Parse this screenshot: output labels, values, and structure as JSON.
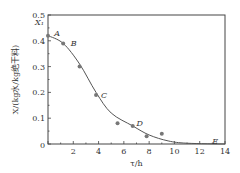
{
  "chart_data": {
    "type": "scatter",
    "title": "",
    "xlabel": "τ/h",
    "ylabel": "X/(kg水/kg绝干料)",
    "xlim": [
      0,
      14
    ],
    "ylim": [
      0,
      0.5
    ],
    "xticks": [
      2,
      4,
      6,
      8,
      10,
      12,
      14
    ],
    "yticks": [
      0,
      0.1,
      0.2,
      0.3,
      0.4,
      0.5
    ],
    "grid": false,
    "points": [
      {
        "x": 0,
        "y": 0.42
      },
      {
        "x": 1.2,
        "y": 0.39
      },
      {
        "x": 2.5,
        "y": 0.3
      },
      {
        "x": 3.8,
        "y": 0.19
      },
      {
        "x": 5.5,
        "y": 0.08
      },
      {
        "x": 6.7,
        "y": 0.07
      },
      {
        "x": 7.8,
        "y": 0.03
      },
      {
        "x": 9.0,
        "y": 0.04
      }
    ],
    "curve": [
      {
        "x": 0,
        "y": 0.42
      },
      {
        "x": 1.2,
        "y": 0.39
      },
      {
        "x": 2.5,
        "y": 0.31
      },
      {
        "x": 3.8,
        "y": 0.2
      },
      {
        "x": 5.0,
        "y": 0.12
      },
      {
        "x": 6.7,
        "y": 0.07
      },
      {
        "x": 8.0,
        "y": 0.035
      },
      {
        "x": 9.5,
        "y": 0.012
      },
      {
        "x": 11,
        "y": 0.003
      },
      {
        "x": 14,
        "y": 0.0
      }
    ],
    "annotations": [
      {
        "text": "X₁",
        "x": 0,
        "y": 0.42
      },
      {
        "text": "A",
        "x": 0.5,
        "y": 0.43
      },
      {
        "text": "B",
        "x": 1.8,
        "y": 0.39
      },
      {
        "text": "C",
        "x": 4.2,
        "y": 0.19
      },
      {
        "text": "D",
        "x": 7.0,
        "y": 0.08
      },
      {
        "text": "E",
        "x": 13.0,
        "y": 0.01
      }
    ]
  }
}
